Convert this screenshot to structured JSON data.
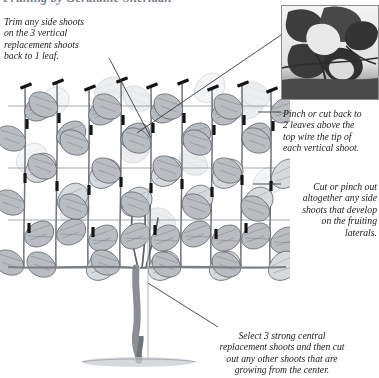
{
  "page": {
    "background_color": "#ffffff",
    "ink_color": "#1a1a1a",
    "title_color": "#7a7f8c"
  },
  "header": {
    "running_title": "Pruning by Geraldine Sheridan"
  },
  "notes": {
    "left": "Trim any side shoots\non the 3 vertical\nreplacement shoots\nback to 1 leaf.",
    "pinch": "Pinch or cut back to\n2 leaves above the\ntop wire the tip of\neach vertical shoot.",
    "cut": "Cut or pinch out\naltogether any side\nshoots that develop\non the fruiting\nlaterals.",
    "select": "Select 3 strong central\nreplacement shoots and then cut\nout any other shoots that are\ngrowing from the center."
  },
  "photo": {
    "caption_name": "grapevine-leaves-photo",
    "description": "Close-up black and white photograph of grapevine leaves on a trained vertical shoot above the top wire"
  },
  "illustration": {
    "name": "grapevine-training-diagram",
    "subject": "Grapevine trained on horizontal wires with vertical fruiting shoots",
    "wire_count": 4,
    "vertical_shoot_count": 9,
    "pruning_mark_label": "pruning-cut-mark"
  },
  "colors": {
    "leaf_fill": "#b9bdc2",
    "leaf_fill_light": "#d7dadd",
    "leaf_outline": "#5d6166",
    "stem": "#6f7478",
    "wire": "#9aa0a6",
    "mark": "#141414",
    "leader": "#3a3a3a",
    "trunk": "#8b8f93",
    "ground": "#c6c9cc"
  }
}
